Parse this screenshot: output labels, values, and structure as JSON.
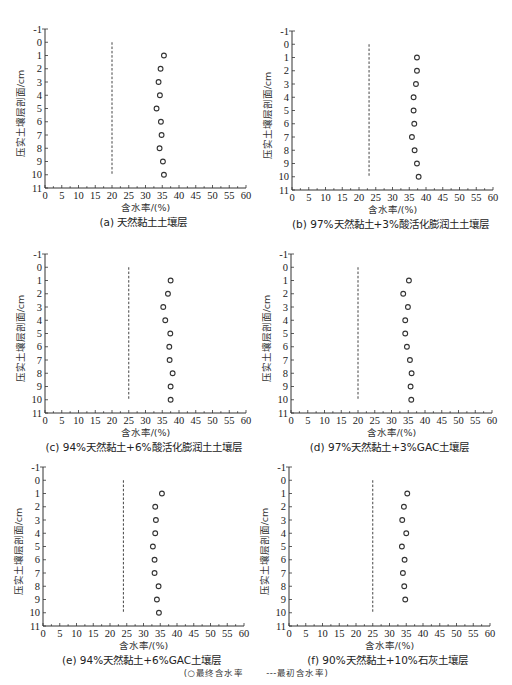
{
  "chart_data": [
    {
      "id": "a",
      "type": "scatter",
      "title": "(a) 天然黏土土壤层",
      "xlabel": "含水率/(%)",
      "ylabel": "压实土壤层剖面/cm",
      "xlim": [
        0,
        60
      ],
      "ylim": [
        -1,
        11
      ],
      "y_inverted": true,
      "xticks": [
        0,
        5,
        10,
        15,
        20,
        25,
        30,
        35,
        40,
        45,
        50,
        55,
        60
      ],
      "yticks": [
        -1,
        0,
        1,
        2,
        3,
        4,
        5,
        6,
        7,
        8,
        9,
        10,
        11
      ],
      "series": [
        {
          "name": "最终含水率",
          "marker": "circle",
          "depth": [
            1,
            2,
            3,
            4,
            5,
            6,
            7,
            8,
            9,
            10
          ],
          "moisture": [
            35.5,
            34.5,
            33.9,
            34.3,
            33.3,
            34.6,
            34.8,
            34.2,
            35.2,
            35.5
          ]
        },
        {
          "name": "最初含水率",
          "style": "dashed-vertical",
          "moisture": 20,
          "depth_range": [
            0,
            10
          ]
        }
      ]
    },
    {
      "id": "b",
      "type": "scatter",
      "title": "(b) 97%天然黏土+3%酸活化膨润土土壤层",
      "xlabel": "含水率/(%)",
      "ylabel": "压实土壤层剖面/cm",
      "xlim": [
        0,
        60
      ],
      "ylim": [
        -1,
        11
      ],
      "y_inverted": true,
      "xticks": [
        0,
        5,
        10,
        15,
        20,
        25,
        30,
        35,
        40,
        45,
        50,
        55,
        60
      ],
      "yticks": [
        -1,
        0,
        1,
        2,
        3,
        4,
        5,
        6,
        7,
        8,
        9,
        10,
        11
      ],
      "series": [
        {
          "name": "最终含水率",
          "marker": "circle",
          "depth": [
            1,
            2,
            3,
            4,
            5,
            6,
            7,
            8,
            9,
            10
          ],
          "moisture": [
            37.3,
            37.3,
            37.0,
            36.3,
            36.3,
            36.5,
            35.8,
            36.6,
            37.3,
            37.8
          ]
        },
        {
          "name": "最初含水率",
          "style": "dashed-vertical",
          "moisture": 23,
          "depth_range": [
            0,
            10
          ]
        }
      ]
    },
    {
      "id": "c",
      "type": "scatter",
      "title": "(c) 94%天然黏土+6%酸活化膨润土土壤层",
      "xlabel": "含水率/(%)",
      "ylabel": "压实土壤层剖面/cm",
      "xlim": [
        0,
        60
      ],
      "ylim": [
        -1,
        11
      ],
      "y_inverted": true,
      "xticks": [
        0,
        5,
        10,
        15,
        20,
        25,
        30,
        35,
        40,
        45,
        50,
        55,
        60
      ],
      "yticks": [
        -1,
        0,
        1,
        2,
        3,
        4,
        5,
        6,
        7,
        8,
        9,
        10,
        11
      ],
      "series": [
        {
          "name": "最终含水率",
          "marker": "circle",
          "depth": [
            1,
            2,
            3,
            4,
            5,
            6,
            7,
            8,
            9,
            10
          ],
          "moisture": [
            37.5,
            36.7,
            35.3,
            35.9,
            37.4,
            37.1,
            37.2,
            38.1,
            37.5,
            37.5
          ]
        },
        {
          "name": "最初含水率",
          "style": "dashed-vertical",
          "moisture": 25,
          "depth_range": [
            0,
            10
          ]
        }
      ]
    },
    {
      "id": "d",
      "type": "scatter",
      "title": "(d) 97%天然黏土+3%GAC土壤层",
      "xlabel": "含水率/(%)",
      "ylabel": "压实土壤层剖面/cm",
      "xlim": [
        0,
        60
      ],
      "ylim": [
        -1,
        11
      ],
      "y_inverted": true,
      "xticks": [
        0,
        5,
        10,
        15,
        20,
        25,
        30,
        35,
        40,
        45,
        50,
        55,
        60
      ],
      "yticks": [
        -1,
        0,
        1,
        2,
        3,
        4,
        5,
        6,
        7,
        8,
        9,
        10,
        11
      ],
      "series": [
        {
          "name": "最终含水率",
          "marker": "circle",
          "depth": [
            1,
            2,
            3,
            4,
            5,
            6,
            7,
            8,
            9,
            10
          ],
          "moisture": [
            35.2,
            33.5,
            34.9,
            34.1,
            34.1,
            34.6,
            35.5,
            36.0,
            35.7,
            35.9
          ]
        },
        {
          "name": "最初含水率",
          "style": "dashed-vertical",
          "moisture": 20,
          "depth_range": [
            0,
            10
          ]
        }
      ]
    },
    {
      "id": "e",
      "type": "scatter",
      "title": "(e) 94%天然黏土+6%GAC土壤层",
      "xlabel": "含水率/(%)",
      "ylabel": "压实土壤层剖面/cm",
      "xlim": [
        0,
        60
      ],
      "ylim": [
        -1,
        11
      ],
      "y_inverted": true,
      "xticks": [
        0,
        5,
        10,
        15,
        20,
        25,
        30,
        35,
        40,
        45,
        50,
        55,
        60
      ],
      "yticks": [
        -1,
        0,
        1,
        2,
        3,
        4,
        5,
        6,
        7,
        8,
        9,
        10,
        11
      ],
      "series": [
        {
          "name": "最终含水率",
          "marker": "circle",
          "depth": [
            1,
            2,
            3,
            4,
            5,
            6,
            7,
            8,
            9,
            10
          ],
          "moisture": [
            35.5,
            33.5,
            33.7,
            33.5,
            32.8,
            33.3,
            33.3,
            34.5,
            34.0,
            34.6
          ]
        },
        {
          "name": "最初含水率",
          "style": "dashed-vertical",
          "moisture": 24,
          "depth_range": [
            0,
            10
          ]
        }
      ]
    },
    {
      "id": "f",
      "type": "scatter",
      "title": "(f) 90%天然黏土+10%石灰土壤层",
      "xlabel": "含水率/(%)",
      "ylabel": "压实土壤层剖面/cm",
      "xlim": [
        0,
        60
      ],
      "ylim": [
        -1,
        11
      ],
      "y_inverted": true,
      "xticks": [
        0,
        5,
        10,
        15,
        20,
        25,
        30,
        35,
        40,
        45,
        50,
        55,
        60
      ],
      "yticks": [
        -1,
        0,
        1,
        2,
        3,
        4,
        5,
        6,
        7,
        8,
        9,
        10,
        11
      ],
      "series": [
        {
          "name": "最终含水率",
          "marker": "circle",
          "depth": [
            1,
            2,
            3,
            4,
            5,
            6,
            7,
            8,
            9
          ],
          "moisture": [
            35.3,
            34.3,
            33.8,
            35.0,
            33.7,
            34.5,
            34.0,
            34.4,
            34.7
          ]
        },
        {
          "name": "最初含水率",
          "style": "dashed-vertical",
          "moisture": 25,
          "depth_range": [
            0,
            10
          ]
        }
      ]
    }
  ],
  "legend": {
    "open": "(",
    "final_marker": "○",
    "final_label": "最终含水率",
    "initial_marker": "---",
    "initial_label": "最初含水率",
    "close": ")"
  }
}
